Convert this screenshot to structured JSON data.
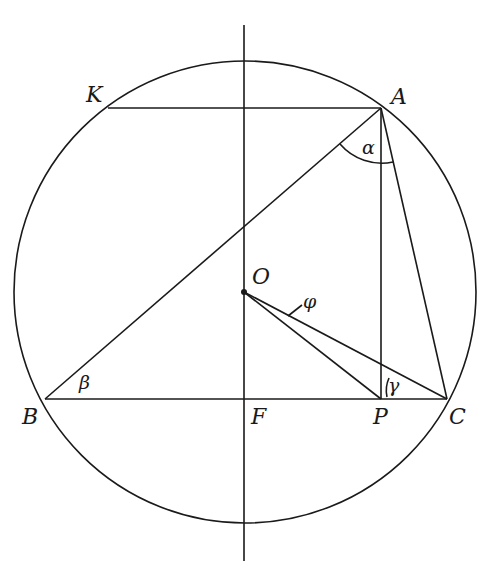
{
  "diagram": {
    "type": "circle-geometry",
    "points": {
      "K": {
        "label": "K",
        "x": 110,
        "y": 108
      },
      "A": {
        "label": "A",
        "x": 381,
        "y": 108
      },
      "B": {
        "label": "B",
        "x": 45,
        "y": 399
      },
      "F": {
        "label": "F",
        "x": 244,
        "y": 399
      },
      "P": {
        "label": "P",
        "x": 381,
        "y": 399
      },
      "C": {
        "label": "C",
        "x": 447,
        "y": 399
      },
      "O": {
        "label": "O",
        "x": 244,
        "y": 292
      }
    },
    "angles": {
      "alpha": "α",
      "beta": "β",
      "gamma": "γ",
      "phi": "φ"
    },
    "circle": {
      "cx": 245,
      "cy": 292,
      "r": 231
    },
    "stroke_color": "#1a1a1a"
  }
}
